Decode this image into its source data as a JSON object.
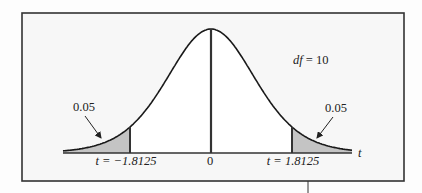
{
  "chart_data": {
    "type": "area",
    "title": "",
    "distribution": "Student t",
    "df_label": "df = 10",
    "df": 10,
    "xlabel": "t",
    "ylabel": "",
    "x_ticks": [
      {
        "value": -1.8125,
        "label": "t = −1.8125"
      },
      {
        "value": 0,
        "label": "0"
      },
      {
        "value": 1.8125,
        "label": "t = 1.8125"
      }
    ],
    "shaded_regions": [
      {
        "from": "-inf",
        "to": -1.8125,
        "area": 0.05,
        "label": "0.05"
      },
      {
        "from": 1.8125,
        "to": "inf",
        "area": 0.05,
        "label": "0.05"
      }
    ],
    "grid": false,
    "legend": "none",
    "colors": {
      "curve": "#1a1a1a",
      "shade": "#c4c4c4",
      "frame": "#333333",
      "background": "#fafafa"
    }
  },
  "labels": {
    "df": "df = 10",
    "df_var": "df",
    "df_eq": " = 10",
    "left_area": "0.05",
    "right_area": "0.05",
    "left_crit": "t = −1.8125",
    "center": "0",
    "right_crit": "t = 1.8125",
    "axis_var": "t"
  }
}
